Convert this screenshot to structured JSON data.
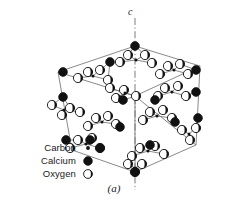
{
  "figure": {
    "caption": "(a)",
    "axis_label": "c"
  },
  "legend": {
    "items": [
      {
        "label": "Carbon",
        "symbol": "small-filled-dot",
        "color": "#000000"
      },
      {
        "label": "Calcium",
        "symbol": "large-filled-circle",
        "color": "#000000"
      },
      {
        "label": "Oxygen",
        "symbol": "half-shaded-circle",
        "color": "#000000"
      }
    ]
  },
  "colors": {
    "line": "#555555",
    "atom_outline": "#111111",
    "calcium_fill": "#111111",
    "oxygen_fill": "#ffffff",
    "oxygen_shade": "#111111",
    "background": "#ffffff",
    "axis": "#555555"
  },
  "chart_data": {
    "type": "scatter",
    "title": "",
    "xlabel": "",
    "ylabel": "",
    "axis": {
      "label": "c",
      "style": "dash-dot",
      "x": 135,
      "y_top": 18,
      "y_bottom": 190
    },
    "cell_vertices": {
      "top": [
        135,
        46
      ],
      "upper_left": [
        58,
        72
      ],
      "upper_right": [
        200,
        66
      ],
      "left": [
        58,
        97
      ],
      "right": [
        200,
        92
      ],
      "mid_left_low": [
        58,
        140
      ],
      "mid_right_low": [
        200,
        120
      ],
      "lower_left": [
        72,
        150
      ],
      "lower_right": [
        196,
        145
      ],
      "bottom": [
        135,
        172
      ]
    },
    "calcium_atoms": [
      [
        135,
        46
      ],
      [
        63,
        72
      ],
      [
        196,
        70
      ],
      [
        110,
        62
      ],
      [
        63,
        97
      ],
      [
        196,
        92
      ],
      [
        66,
        140
      ],
      [
        198,
        118
      ],
      [
        90,
        140
      ],
      [
        155,
        100
      ],
      [
        123,
        100
      ],
      [
        150,
        145
      ],
      [
        100,
        148
      ],
      [
        135,
        172
      ],
      [
        175,
        122
      ],
      [
        120,
        127
      ]
    ],
    "oxygen_atoms": [
      [
        128,
        55
      ],
      [
        145,
        55
      ],
      [
        120,
        62
      ],
      [
        152,
        63
      ],
      [
        88,
        72
      ],
      [
        100,
        70
      ],
      [
        78,
        78
      ],
      [
        108,
        80
      ],
      [
        168,
        66
      ],
      [
        180,
        64
      ],
      [
        160,
        74
      ],
      [
        188,
        74
      ],
      [
        52,
        105
      ],
      [
        70,
        108
      ],
      [
        62,
        115
      ],
      [
        80,
        112
      ],
      [
        110,
        88
      ],
      [
        124,
        90
      ],
      [
        116,
        98
      ],
      [
        136,
        96
      ],
      [
        165,
        88
      ],
      [
        178,
        86
      ],
      [
        158,
        96
      ],
      [
        186,
        96
      ],
      [
        96,
        118
      ],
      [
        108,
        116
      ],
      [
        88,
        126
      ],
      [
        116,
        124
      ],
      [
        150,
        112
      ],
      [
        163,
        110
      ],
      [
        143,
        120
      ],
      [
        172,
        118
      ],
      [
        78,
        140
      ],
      [
        92,
        138
      ],
      [
        70,
        148
      ],
      [
        100,
        148
      ],
      [
        140,
        148
      ],
      [
        155,
        146
      ],
      [
        132,
        156
      ],
      [
        164,
        154
      ],
      [
        182,
        130
      ],
      [
        196,
        128
      ],
      [
        190,
        140
      ],
      [
        128,
        164
      ],
      [
        142,
        164
      ],
      [
        135,
        172
      ]
    ],
    "carbon_atoms": [
      [
        136,
        60
      ],
      [
        93,
        76
      ],
      [
        174,
        70
      ],
      [
        64,
        110
      ],
      [
        125,
        93
      ],
      [
        172,
        92
      ],
      [
        102,
        122
      ],
      [
        157,
        116
      ],
      [
        86,
        144
      ],
      [
        148,
        151
      ],
      [
        189,
        134
      ],
      [
        135,
        168
      ]
    ]
  }
}
